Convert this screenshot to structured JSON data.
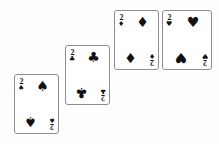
{
  "scene": {
    "title": "Four playing cards arranged in a diagonal staircase",
    "background_color": "#fefefe",
    "card_face_color": "#ffffff",
    "card_border_color": "#8d8d8d",
    "ink_color": "#111111",
    "card_count": 4
  },
  "cards": [
    {
      "id": "card-2-spades",
      "rank": "2",
      "suit_name": "spades",
      "suit_glyph": "♠",
      "label": "2 of Spades",
      "color": "#111111",
      "left": 14,
      "top": 74,
      "width": 45,
      "height": 60
    },
    {
      "id": "card-2-clubs",
      "rank": "2",
      "suit_name": "clubs",
      "suit_glyph": "♣",
      "label": "2 of Clubs",
      "color": "#111111",
      "left": 65,
      "top": 45,
      "width": 45,
      "height": 60
    },
    {
      "id": "card-2-diamonds",
      "rank": "2",
      "suit_name": "diamonds",
      "suit_glyph": "♦",
      "label": "2 of Diamonds",
      "color": "#111111",
      "left": 114,
      "top": 10,
      "width": 45,
      "height": 60
    },
    {
      "id": "card-2-hearts",
      "rank": "2",
      "suit_name": "hearts",
      "suit_glyph": "♥",
      "label": "2 of Hearts",
      "color": "#111111",
      "left": 162,
      "top": 10,
      "width": 50,
      "height": 60
    }
  ]
}
